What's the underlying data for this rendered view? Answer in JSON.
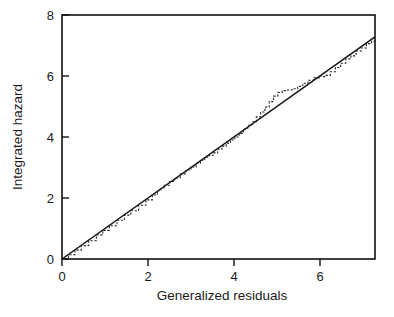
{
  "figure": {
    "width": 394,
    "height": 317,
    "background": "#ffffff",
    "ink_color": "#111111"
  },
  "chart_data": {
    "type": "line",
    "title": "",
    "subtitle": "",
    "xlabel": "Generalized residuals",
    "ylabel": "Integrated hazard",
    "xlim": [
      0,
      7.28
    ],
    "ylim": [
      0,
      8
    ],
    "xticks": [
      0,
      2,
      4,
      6
    ],
    "yticks": [
      0,
      2,
      4,
      6,
      8
    ],
    "xtick_labels": [
      "0",
      "2",
      "4",
      "6"
    ],
    "ytick_labels": [
      "0",
      "2",
      "4",
      "6",
      "8"
    ],
    "grid": false,
    "legend": "none",
    "frame": "box",
    "xtick_direction": "out",
    "ytick_direction": "in",
    "series": [
      {
        "name": "reference-line",
        "style": "solid",
        "description": "45 degree identity reference line through the origin",
        "x": [
          0,
          7.28
        ],
        "values": [
          0,
          7.28
        ]
      },
      {
        "name": "empirical-integrated-hazard",
        "style": "dashed-step",
        "description": "Stepped Nelson-Aalen estimate of the integrated hazard of the generalized (Cox-Snell) residuals",
        "x": [
          0.0,
          0.15,
          0.3,
          0.45,
          0.62,
          0.8,
          0.95,
          1.1,
          1.28,
          1.45,
          1.6,
          1.78,
          1.95,
          2.1,
          2.22,
          2.3,
          2.38,
          2.5,
          2.62,
          2.75,
          2.88,
          3.0,
          3.12,
          3.22,
          3.32,
          3.42,
          3.52,
          3.62,
          3.72,
          3.82,
          3.92,
          4.02,
          4.12,
          4.22,
          4.32,
          4.42,
          4.52,
          4.62,
          4.72,
          4.82,
          4.92,
          5.02,
          5.12,
          5.22,
          5.35,
          5.48,
          5.6,
          5.72,
          5.85,
          5.98,
          6.06,
          6.14,
          6.24,
          6.36,
          6.48,
          6.6,
          6.72,
          6.84,
          6.96,
          7.08,
          7.2,
          7.28
        ],
        "values": [
          0.0,
          0.14,
          0.29,
          0.44,
          0.6,
          0.79,
          0.94,
          1.09,
          1.27,
          1.44,
          1.58,
          1.76,
          1.94,
          2.1,
          2.24,
          2.34,
          2.42,
          2.54,
          2.66,
          2.79,
          2.92,
          3.02,
          3.14,
          3.24,
          3.34,
          3.4,
          3.48,
          3.6,
          3.7,
          3.8,
          3.9,
          4.0,
          4.12,
          4.26,
          4.38,
          4.5,
          4.66,
          4.82,
          4.98,
          5.16,
          5.34,
          5.46,
          5.52,
          5.54,
          5.58,
          5.66,
          5.76,
          5.86,
          5.94,
          6.0,
          5.98,
          6.02,
          6.14,
          6.28,
          6.42,
          6.56,
          6.66,
          6.82,
          6.92,
          7.06,
          7.14,
          7.16
        ]
      }
    ]
  },
  "axes": {
    "x_title": "Generalized residuals",
    "y_title": "Integrated hazard"
  }
}
